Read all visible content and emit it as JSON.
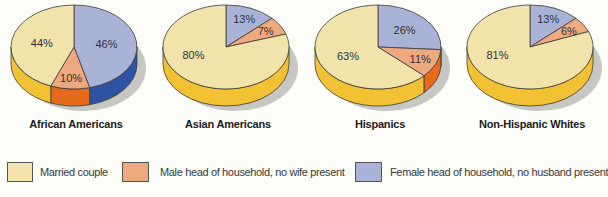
{
  "colors": {
    "married": {
      "top": "#F1E3A9",
      "side": "#F2C234"
    },
    "male_head": {
      "top": "#EFA97E",
      "side": "#E66C1C"
    },
    "female_head": {
      "top": "#A9B3D6",
      "side": "#2C54A2"
    },
    "outline": "#3B3A38",
    "shadow": "#C6C6C3",
    "label_text": "#303238"
  },
  "legend": {
    "items": [
      {
        "id": "married",
        "label": "Married couple"
      },
      {
        "id": "male_head",
        "label": "Male head of household, no wife present"
      },
      {
        "id": "female_head",
        "label": "Female head of household, no husband present"
      }
    ]
  },
  "chart_data": {
    "type": "pie",
    "style": "3d",
    "unit": "percent",
    "start_angle": "12-oclock",
    "direction": "clockwise",
    "categories": [
      "Married couple",
      "Male head of household, no wife present",
      "Female head of household, no husband present"
    ],
    "pies": [
      {
        "title": "African Americans",
        "slices": [
          {
            "category": "female_head",
            "value": 46,
            "label": "46%"
          },
          {
            "category": "male_head",
            "value": 10,
            "label": "10%"
          },
          {
            "category": "married",
            "value": 44,
            "label": "44%"
          }
        ]
      },
      {
        "title": "Asian Americans",
        "slices": [
          {
            "category": "female_head",
            "value": 13,
            "label": "13%"
          },
          {
            "category": "male_head",
            "value": 7,
            "label": "7%"
          },
          {
            "category": "married",
            "value": 80,
            "label": "80%"
          }
        ]
      },
      {
        "title": "Hispanics",
        "slices": [
          {
            "category": "female_head",
            "value": 26,
            "label": "26%"
          },
          {
            "category": "male_head",
            "value": 11,
            "label": "11%"
          },
          {
            "category": "married",
            "value": 63,
            "label": "63%"
          }
        ]
      },
      {
        "title": "Non-Hispanic Whites",
        "slices": [
          {
            "category": "female_head",
            "value": 13,
            "label": "13%"
          },
          {
            "category": "male_head",
            "value": 6,
            "label": "6%"
          },
          {
            "category": "married",
            "value": 81,
            "label": "81%"
          }
        ]
      }
    ]
  }
}
